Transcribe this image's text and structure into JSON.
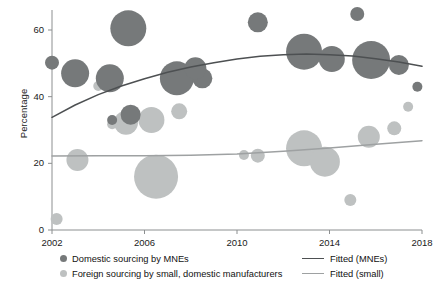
{
  "chart_data": {
    "type": "scatter",
    "title": "",
    "subtitle": "",
    "xlabel": "",
    "ylabel": "Percentage",
    "xlim": [
      2002,
      2018
    ],
    "ylim": [
      0,
      66
    ],
    "grid": false,
    "legend_position": "bottom",
    "x_ticks": [
      2002,
      2006,
      2010,
      2014,
      2018
    ],
    "y_ticks": [
      0,
      20,
      40,
      60
    ],
    "colors": {
      "mnes": "#76797a",
      "small": "#bec1c1",
      "fitted_mnes": "#4d5052",
      "fitted_small": "#9ea1a2",
      "axis": "#8c8f90",
      "text": "#141414"
    },
    "annotations": [],
    "series": [
      {
        "name": "Domestic sourcing by MNEs",
        "marker": "bubble",
        "color": "#76797a",
        "points": [
          {
            "x": 2002.0,
            "y": 50.2,
            "size": 7
          },
          {
            "x": 2003.0,
            "y": 47.0,
            "size": 14
          },
          {
            "x": 2004.5,
            "y": 45.5,
            "size": 14
          },
          {
            "x": 2004.6,
            "y": 33.0,
            "size": 5
          },
          {
            "x": 2005.4,
            "y": 34.6,
            "size": 10
          },
          {
            "x": 2005.3,
            "y": 60.5,
            "size": 18
          },
          {
            "x": 2007.4,
            "y": 45.5,
            "size": 17
          },
          {
            "x": 2008.5,
            "y": 45.5,
            "size": 10
          },
          {
            "x": 2008.2,
            "y": 48.5,
            "size": 11
          },
          {
            "x": 2010.9,
            "y": 62.3,
            "size": 10
          },
          {
            "x": 2012.9,
            "y": 53.5,
            "size": 18
          },
          {
            "x": 2014.1,
            "y": 51.3,
            "size": 13
          },
          {
            "x": 2015.2,
            "y": 64.8,
            "size": 7
          },
          {
            "x": 2015.8,
            "y": 51.0,
            "size": 19
          },
          {
            "x": 2017.0,
            "y": 49.5,
            "size": 10
          },
          {
            "x": 2017.8,
            "y": 43.0,
            "size": 5
          }
        ]
      },
      {
        "name": "Foreign sourcing by small, domestic manufacturers",
        "marker": "bubble",
        "color": "#bec1c1",
        "points": [
          {
            "x": 2002.2,
            "y": 3.3,
            "size": 6
          },
          {
            "x": 2003.1,
            "y": 21.0,
            "size": 11
          },
          {
            "x": 2004.6,
            "y": 31.7,
            "size": 5
          },
          {
            "x": 2005.2,
            "y": 32.2,
            "size": 12
          },
          {
            "x": 2006.3,
            "y": 33.0,
            "size": 13
          },
          {
            "x": 2004.0,
            "y": 43.2,
            "size": 5
          },
          {
            "x": 2007.5,
            "y": 35.6,
            "size": 8
          },
          {
            "x": 2006.5,
            "y": 16.0,
            "size": 22
          },
          {
            "x": 2010.3,
            "y": 22.5,
            "size": 5
          },
          {
            "x": 2010.9,
            "y": 22.3,
            "size": 7
          },
          {
            "x": 2012.9,
            "y": 24.5,
            "size": 18
          },
          {
            "x": 2013.8,
            "y": 20.5,
            "size": 15
          },
          {
            "x": 2015.7,
            "y": 28.0,
            "size": 11
          },
          {
            "x": 2014.9,
            "y": 9.0,
            "size": 6
          },
          {
            "x": 2017.4,
            "y": 37.0,
            "size": 5
          },
          {
            "x": 2016.8,
            "y": 30.5,
            "size": 7
          }
        ]
      }
    ],
    "fits": [
      {
        "name": "Fitted (MNEs)",
        "color": "#4d5052",
        "points": [
          {
            "x": 2002.0,
            "y": 33.8
          },
          {
            "x": 2003.0,
            "y": 37.5
          },
          {
            "x": 2004.0,
            "y": 40.6
          },
          {
            "x": 2005.0,
            "y": 43.2
          },
          {
            "x": 2006.0,
            "y": 45.4
          },
          {
            "x": 2007.0,
            "y": 47.3
          },
          {
            "x": 2008.0,
            "y": 48.9
          },
          {
            "x": 2009.0,
            "y": 50.2
          },
          {
            "x": 2010.0,
            "y": 51.3
          },
          {
            "x": 2011.0,
            "y": 52.1
          },
          {
            "x": 2012.0,
            "y": 52.6
          },
          {
            "x": 2013.0,
            "y": 52.8
          },
          {
            "x": 2014.0,
            "y": 52.6
          },
          {
            "x": 2015.0,
            "y": 52.2
          },
          {
            "x": 2016.0,
            "y": 51.4
          },
          {
            "x": 2017.0,
            "y": 50.4
          },
          {
            "x": 2018.0,
            "y": 49.1
          }
        ]
      },
      {
        "name": "Fitted (small)",
        "color": "#9ea1a2",
        "points": [
          {
            "x": 2002.0,
            "y": 22.2
          },
          {
            "x": 2004.0,
            "y": 22.3
          },
          {
            "x": 2006.0,
            "y": 22.3
          },
          {
            "x": 2008.0,
            "y": 22.4
          },
          {
            "x": 2010.0,
            "y": 22.8
          },
          {
            "x": 2012.0,
            "y": 23.6
          },
          {
            "x": 2014.0,
            "y": 24.6
          },
          {
            "x": 2016.0,
            "y": 25.7
          },
          {
            "x": 2018.0,
            "y": 26.8
          }
        ]
      }
    ]
  },
  "axis": {
    "y_label": "Percentage",
    "y_tick_labels": [
      "60",
      "40",
      "20",
      "0"
    ],
    "x_tick_labels": [
      "2002",
      "2006",
      "2010",
      "2014",
      "2018"
    ]
  },
  "legend": {
    "items": [
      {
        "marker": "dot",
        "label": "Domestic sourcing by MNEs",
        "color": "#76797a"
      },
      {
        "marker": "dot",
        "label": "Foreign sourcing by small, domestic manufacturers",
        "color": "#bec1c1"
      },
      {
        "marker": "line",
        "label": "Fitted (MNEs)",
        "color": "#4d5052"
      },
      {
        "marker": "line",
        "label": "Fitted (small)",
        "color": "#9ea1a2"
      }
    ]
  }
}
